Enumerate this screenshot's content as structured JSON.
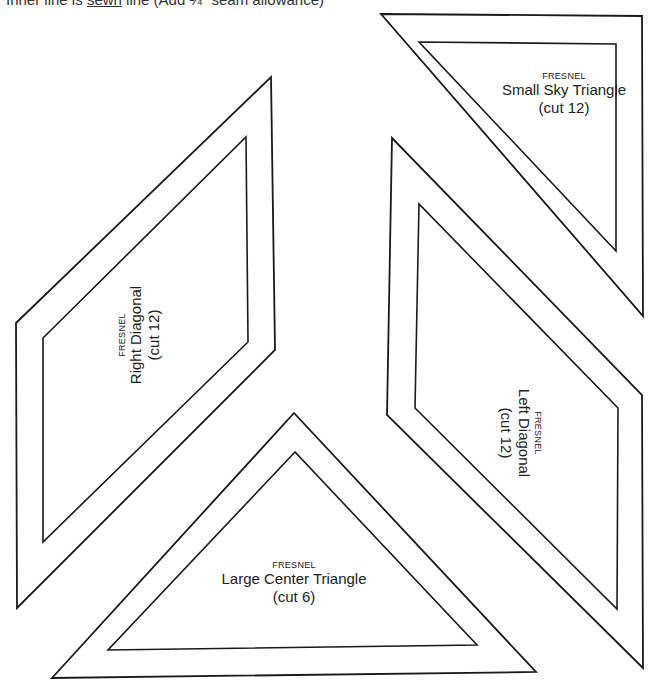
{
  "header": {
    "note_prefix": "Inner line is",
    "note_underlined": "sewn",
    "note_suffix": "line (Add ¼\" seam allowance)"
  },
  "pieces": [
    {
      "id": "small-sky-triangle",
      "brand": "FRESNEL",
      "name": "Small Sky Triangle",
      "cut": "(cut 12)",
      "outer": "381,14 642,16 643,316",
      "inner": "419,42 616,44 616,251",
      "label_rotation": 0
    },
    {
      "id": "right-diagonal",
      "brand": "FRESNEL",
      "name": "Right Diagonal",
      "cut": "(cut 12)",
      "outer": "271,77 275,350 17,608 16,323",
      "inner": "246,137 248,342 43,542 43,338",
      "label_rotation": -90
    },
    {
      "id": "left-diagonal",
      "brand": "FRESNEL",
      "name": "Left Diagonal",
      "cut": "(cut 12)",
      "outer": "392,138 387,415 643,668 642,395",
      "inner": "419,204 415,408 617,609 618,408",
      "label_rotation": 90
    },
    {
      "id": "large-center-triangle",
      "brand": "FRESNEL",
      "name": "Large Center Triangle",
      "cut": "(cut 6)",
      "outer": "294,413 52,678 536,672",
      "inner": "295,452 108,650 477,645",
      "label_rotation": 0
    }
  ],
  "colors": {
    "line": "#1a1a1a",
    "background": "#ffffff"
  }
}
